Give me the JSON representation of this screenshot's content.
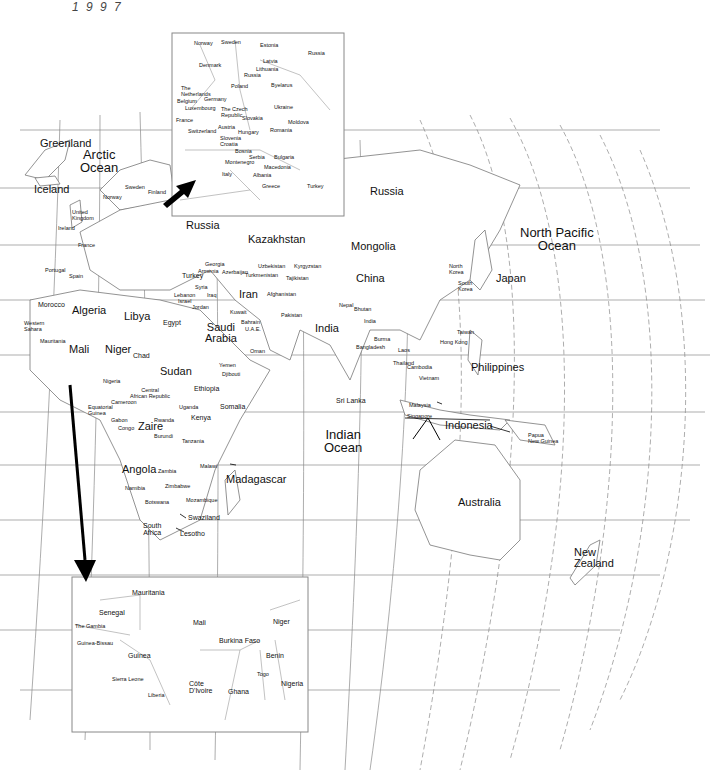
{
  "corner_note": "1 9 9 7",
  "oceans": {
    "arctic": "Arctic\nOcean",
    "north_pacific": "North Pacific\nOcean",
    "indian": "Indian\nOcean"
  },
  "regions": {
    "greenland": "Greenland",
    "iceland": "Iceland",
    "sweden": "Sweden",
    "finland": "Finland",
    "norway": "Norway",
    "united_kingdom": "United\nKingdom",
    "ireland": "Ireland",
    "france": "France",
    "portugal": "Portugal",
    "spain": "Spain",
    "morocco": "Morocco",
    "western_sahara": "Western\nSahara",
    "mauritania": "Mauritania",
    "algeria": "Algeria",
    "libya": "Libya",
    "egypt": "Egypt",
    "mali": "Mali",
    "niger": "Niger",
    "chad": "Chad",
    "sudan": "Sudan",
    "nigeria": "Nigeria",
    "central_african_republic": "Central\nAfrican Republic",
    "cameroon": "Cameroon",
    "equatorial_guinea": "Equatorial\nGuinea",
    "gabon": "Gabon",
    "congo": "Congo",
    "zaire": "Zaire",
    "rwanda": "Rwanda",
    "burundi": "Burundi",
    "uganda": "Uganda",
    "kenya": "Kenya",
    "tanzania": "Tanzania",
    "ethiopia": "Ethiopia",
    "somalia": "Somalia",
    "djibouti": "Djibouti",
    "yemen": "Yemen",
    "oman": "Oman",
    "angola": "Angola",
    "zambia": "Zambia",
    "malawi": "Malawi",
    "namibia": "Namibia",
    "zimbabwe": "Zimbabwe",
    "botswana": "Botswana",
    "mozambique": "Mozambique",
    "madagascar": "Madagascar",
    "swaziland": "Swaziland",
    "south_africa": "South\nAfrica",
    "lesotho": "Lesotho",
    "russia_west": "Russia",
    "russia_east": "Russia",
    "kazakhstan": "Kazakhstan",
    "georgia": "Georgia",
    "armenia": "Armenia",
    "azerbaijan": "Azerbaijan",
    "turkey": "Turkey",
    "syria": "Syria",
    "lebanon": "Lebanon",
    "israel": "Israel",
    "jordan": "Jordan",
    "iraq": "Iraq",
    "iran": "Iran",
    "kuwait": "Kuwait",
    "bahrain": "Bahrain",
    "uae": "U.A.E.",
    "saudi_arabia": "Saudi\nArabia",
    "uzbekistan": "Uzbekistan",
    "turkmenistan": "Turkmenistan",
    "kyrgyzstan": "Kyrgyzstan",
    "tajikistan": "Tajikistan",
    "afghanistan": "Afghanistan",
    "pakistan": "Pakistan",
    "india": "India",
    "india_small": "India",
    "nepal": "Nepal",
    "bhutan": "Bhutan",
    "bangladesh": "Bangladesh",
    "burma": "Burma",
    "sri_lanka": "Sri Lanka",
    "mongolia": "Mongolia",
    "china": "China",
    "north_korea": "North\nKorea",
    "south_korea": "South\nKorea",
    "japan": "Japan",
    "taiwan": "Taiwan",
    "hong_kong": "Hong Kong",
    "laos": "Laos",
    "thailand": "Thailand",
    "cambodia": "Cambodia",
    "vietnam": "Vietnam",
    "philippines": "Philippines",
    "malaysia": "Malaysia",
    "singapore": "Singapore",
    "indonesia": "Indonesia",
    "papua_new_guinea": "Papua\nNew Guinea",
    "australia": "Australia",
    "new_zealand": "New\nZealand"
  },
  "inset_europe": {
    "labels": {
      "norway": "Norway",
      "sweden": "Sweden",
      "estonia": "Estonia",
      "russia": "Russia",
      "latvia": "Latvia",
      "denmark": "Denmark",
      "lithuania": "Lithuania",
      "russia_small": "Russia",
      "the_netherlands": "The\nNetherlands",
      "poland": "Poland",
      "byelarus": "Byelarus",
      "belgium": "Belgium",
      "germany": "Germany",
      "luxembourg": "Luxembourg",
      "czech": "The Czech\nRepublic",
      "slovakia": "Slovakia",
      "ukraine": "Ukraine",
      "france": "France",
      "moldova": "Moldova",
      "switzerland": "Switzerland",
      "austria": "Austria",
      "hungary": "Hungary",
      "romania": "Romania",
      "slovenia": "Slovenia",
      "croatia": "Croatia",
      "bosnia": "Bosnia",
      "serbia": "Serbia",
      "bulgaria": "Bulgaria",
      "montenegro": "Montenegro",
      "macedonia": "Macedonia",
      "italy": "Italy",
      "albania": "Albania",
      "greece": "Greece",
      "turkey": "Turkey"
    }
  },
  "inset_west_africa": {
    "labels": {
      "mauritania": "Mauritania",
      "senegal": "Senegal",
      "the_gambia": "The Gambia",
      "guinea_bissau": "Guinea-Bissau",
      "mali": "Mali",
      "niger": "Niger",
      "burkina_faso": "Burkina Faso",
      "guinea": "Guinea",
      "benin": "Benin",
      "sierra_leone": "Sierra Leone",
      "togo": "Togo",
      "liberia": "Liberia",
      "cote_divoire": "Côte\nD'Ivoire",
      "ghana": "Ghana",
      "nigeria": "Nigeria"
    }
  },
  "colors": {
    "background": "#ffffff",
    "lines": "#888888",
    "text": "#111111",
    "arrow": "#000000"
  }
}
